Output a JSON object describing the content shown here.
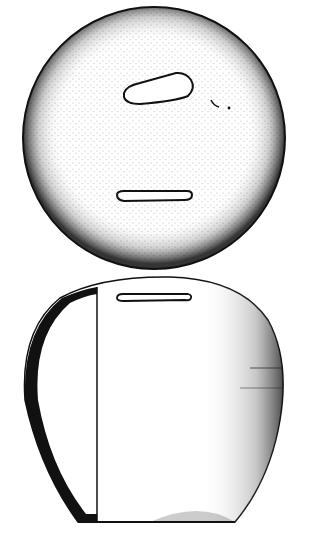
{
  "figure": {
    "views": [
      {
        "name": "top-view",
        "shape": "circle",
        "features": [
          "irregular-perforation",
          "coin-slot",
          "small-chips"
        ]
      },
      {
        "name": "profile-view",
        "shape": "ovoid-section",
        "features": [
          "wall-section",
          "coin-slot",
          "flat-base"
        ]
      }
    ],
    "colors": {
      "ink": "#111111",
      "paper": "#ffffff"
    }
  }
}
